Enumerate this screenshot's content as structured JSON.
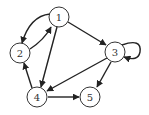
{
  "diagram": {
    "type": "directed-graph",
    "colors": {
      "stroke": "#222222",
      "node_fill": "#ffffff",
      "text": "#333333"
    },
    "nodes": [
      {
        "id": "1",
        "label": "1",
        "x": 59,
        "y": 17
      },
      {
        "id": "2",
        "label": "2",
        "x": 20,
        "y": 53
      },
      {
        "id": "3",
        "label": "3",
        "x": 115,
        "y": 52
      },
      {
        "id": "4",
        "label": "4",
        "x": 37,
        "y": 97
      },
      {
        "id": "5",
        "label": "5",
        "x": 90,
        "y": 97
      }
    ],
    "edges": [
      {
        "from": "1",
        "to": "2",
        "curved": true
      },
      {
        "from": "2",
        "to": "1",
        "curved": true
      },
      {
        "from": "1",
        "to": "3"
      },
      {
        "from": "1",
        "to": "4"
      },
      {
        "from": "3",
        "to": "3",
        "self_loop": true
      },
      {
        "from": "3",
        "to": "4"
      },
      {
        "from": "3",
        "to": "5"
      },
      {
        "from": "4",
        "to": "2"
      },
      {
        "from": "4",
        "to": "5"
      }
    ]
  }
}
